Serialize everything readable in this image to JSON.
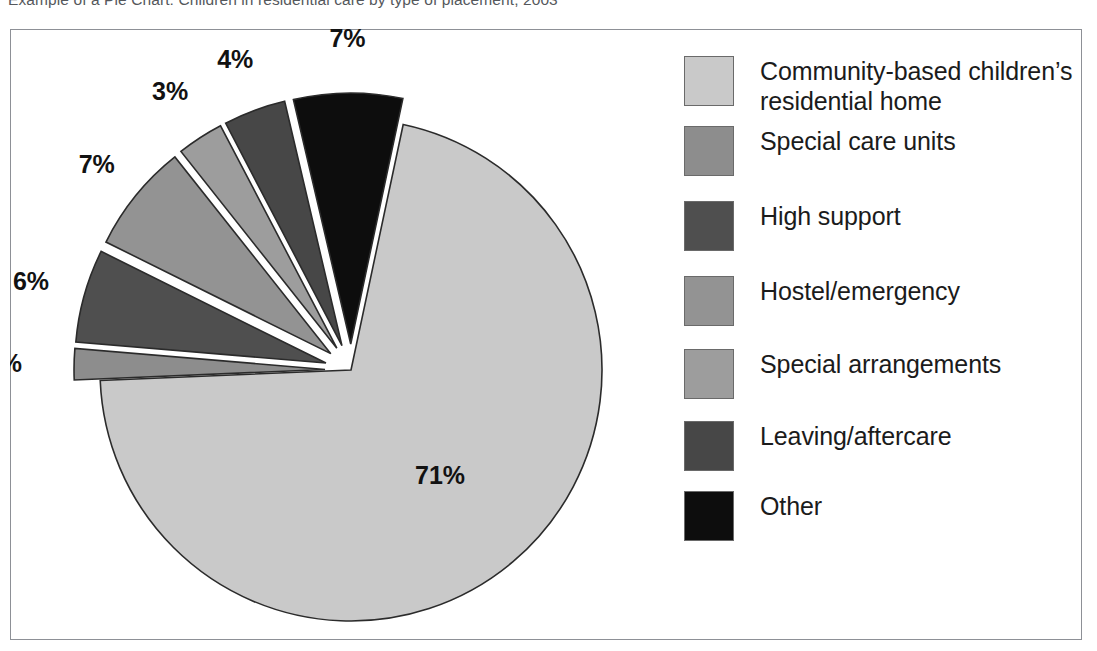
{
  "caption": "Example of a Pie Chart: Children in residential care by type of placement, 2003",
  "frame": {
    "border_color": "#8d9096",
    "background": "#ffffff"
  },
  "chart_data": {
    "type": "pie",
    "title": "Children in residential care by type of placement",
    "xlabel": "",
    "ylabel": "",
    "legend_position": "right",
    "grid": false,
    "explode_note": "All slices except the largest are exploded outward from the centre",
    "categories": [
      "Community-based children’s residential home",
      "Special care units",
      "High support",
      "Hostel/emergency",
      "Special arrangements",
      "Leaving/aftercare",
      "Other"
    ],
    "values": [
      71,
      2,
      6,
      7,
      3,
      4,
      7
    ],
    "labels": [
      "71%",
      "2%",
      "6%",
      "7%",
      "3%",
      "4%",
      "7%"
    ],
    "colors": [
      "#c9c9c9",
      "#8d8d8d",
      "#4f4f4f",
      "#939393",
      "#9d9d9d",
      "#474747",
      "#0d0d0d"
    ]
  },
  "legend": {
    "items": [
      {
        "label": "Community-based children’s\nresidential home",
        "color": "#c9c9c9",
        "swatch_name": "legend-swatch-community-based"
      },
      {
        "label": "Special care units",
        "color": "#8d8d8d",
        "swatch_name": "legend-swatch-special-care-units"
      },
      {
        "label": "High support",
        "color": "#4f4f4f",
        "swatch_name": "legend-swatch-high-support"
      },
      {
        "label": "Hostel/emergency",
        "color": "#939393",
        "swatch_name": "legend-swatch-hostel-emergency"
      },
      {
        "label": "Special arrangements",
        "color": "#9d9d9d",
        "swatch_name": "legend-swatch-special-arrangements"
      },
      {
        "label": "Leaving/aftercare",
        "color": "#474747",
        "swatch_name": "legend-swatch-leaving-aftercare"
      },
      {
        "label": "Other",
        "color": "#0d0d0d",
        "swatch_name": "legend-swatch-other"
      }
    ]
  },
  "pie_geometry": {
    "center_x": 341,
    "center_y": 341,
    "radius": 251,
    "start_angle_deg": 12,
    "explode_offset": 26
  }
}
